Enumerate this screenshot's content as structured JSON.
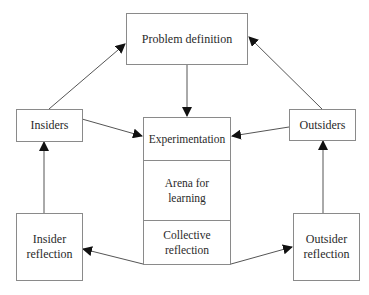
{
  "diagram": {
    "nodes": {
      "problem_definition": "Problem definition",
      "insiders": "Insiders",
      "outsiders": "Outsiders",
      "insider_reflection_1": "Insider",
      "insider_reflection_2": "reflection",
      "outsider_reflection_1": "Outsider",
      "outsider_reflection_2": "reflection"
    },
    "arena": {
      "experimentation": "Experimentation",
      "arena_1": "Arena for",
      "arena_2": "learning",
      "collective_1": "Collective",
      "collective_2": "reflection"
    },
    "edges": [
      {
        "from": "Insiders",
        "to": "Problem definition"
      },
      {
        "from": "Outsiders",
        "to": "Problem definition"
      },
      {
        "from": "Problem definition",
        "to": "Experimentation"
      },
      {
        "from": "Insiders",
        "to": "Experimentation"
      },
      {
        "from": "Outsiders",
        "to": "Experimentation"
      },
      {
        "from": "Collective reflection",
        "to": "Insider reflection"
      },
      {
        "from": "Collective reflection",
        "to": "Outsider reflection"
      },
      {
        "from": "Insider reflection",
        "to": "Insiders"
      },
      {
        "from": "Outsider reflection",
        "to": "Outsiders"
      }
    ]
  }
}
